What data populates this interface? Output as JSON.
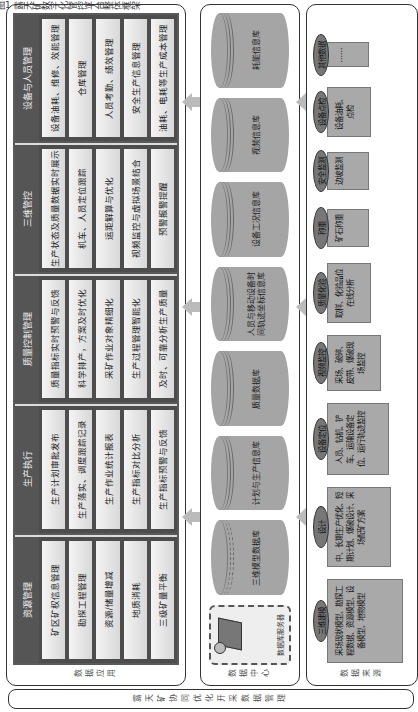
{
  "caption": "图1 露天矿数字化管控平台整体框架",
  "bottom_strip": {
    "label": "露天矿协同优化开采数据管理"
  },
  "panels": {
    "application": {
      "label": "数据应用",
      "modules": [
        {
          "title": "资源管理",
          "items": [
            "矿区矿权信息管理",
            "勘探工程管理",
            "资源/储量增减",
            "地质消耗",
            "三级矿量平衡"
          ]
        },
        {
          "title": "生产执行",
          "items": [
            "生产计划审批发布",
            "生产落实、调度跟踪记录",
            "生产作业统计报表",
            "生产指标对比分析",
            "生产指标预警与反馈"
          ]
        },
        {
          "title": "质量控制管理",
          "items": [
            "质量指标实时预警与反馈",
            "科学排产，方案及时优化",
            "采矿作业对象精细化",
            "生产过程管理智能化",
            "及时、可靠分析生产质量"
          ]
        },
        {
          "title": "三维管控",
          "items": [
            "生产状态及质量数据实时展示",
            "机车、人员定位跟踪",
            "运距解算与优化",
            "视频监控与虚拟场景结合",
            "预警报警提醒"
          ]
        },
        {
          "title": "设备与人员管理",
          "items": [
            "设备油耗、维修、效能管理",
            "仓库管理",
            "人员考勤、绩效管理",
            "安全生产信息管理",
            "油耗、电耗等生产成本管理"
          ]
        }
      ]
    },
    "data_center": {
      "label": "数据中心",
      "server": {
        "label": "数据库服务器",
        "icon": "server-icon"
      },
      "databases": [
        "三维模型数据库",
        "计划与生产信息库",
        "质量数据库",
        "人员与移动设备时间轨迹坐标信息库",
        "设备工况信息库",
        "视频信息库",
        "耗能信息库"
      ]
    },
    "data_source": {
      "label": "数据来源",
      "sources": [
        {
          "tag": "三维建模",
          "text": "采场现状模型、勘探工程数据、资源模型、设备模型、地物模型"
        },
        {
          "tag": "设计",
          "text": "中、长期生产优化、短期计划、爆破设计、采场配矿方案"
        },
        {
          "tag": "设备定位",
          "text": "人员、钻机、铲车、运输设备定位、运行轨迹监控"
        },
        {
          "tag": "视频监控",
          "text": "采场、破碎、皮带、爆破现场监控"
        },
        {
          "tag": "质量化验",
          "text": "取样、化验品位在线分析"
        },
        {
          "tag": "称重",
          "text": "矿石称重"
        },
        {
          "tag": "安全监测",
          "text": "边坡监测"
        },
        {
          "tag": "设备点检",
          "text": "设备油耗、点检"
        },
        {
          "tag": "其他数据",
          "text": "……"
        }
      ]
    }
  },
  "colors": {
    "module_header": "#4d4d4d",
    "item_bg": "#e8e8e8",
    "db_fill": "#a5a5a5",
    "source_card": "#a9a9a9",
    "arrow": "#bbbbbb"
  }
}
